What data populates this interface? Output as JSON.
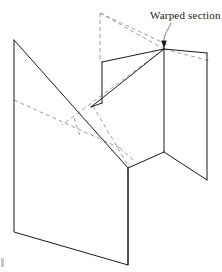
{
  "figure": {
    "background_color": "#ffffff",
    "annotation": {
      "label": "Warped section",
      "text_x": 150,
      "text_y": 19,
      "font_size": 11,
      "color": "#1a1a1a"
    },
    "styles": {
      "solid_color": "#1a1a1a",
      "hidden_color": "#8d8d8d",
      "leader_color": "#5a5a5a",
      "solid_width": 1,
      "hidden_width": 0.85,
      "dash_pattern": "4 3"
    },
    "leader": {
      "path": "M 171 23 C 168 30, 165 33, 164 40",
      "arrow_points": "164,49 161.2,40.5 166.8,40.5"
    },
    "solid_edges": [
      {
        "name": "left-panel-outline",
        "points": "14,40 14,232 128,265 128,168"
      },
      {
        "name": "left-panel-diagonal",
        "points": "14,40 128,168"
      },
      {
        "name": "mid-panel-left-edge-vertical",
        "points": "102,62 102,103"
      },
      {
        "name": "mid-panel-top-edge",
        "points": "102,62 164,49"
      },
      {
        "name": "mid-panel-lower-left-edge",
        "points": "102,103 91,107"
      },
      {
        "name": "warped-upper-fold",
        "points": "91,107 164,49"
      },
      {
        "name": "central-vertical-spine",
        "points": "164,49 164,152"
      },
      {
        "name": "right-panel-top-edge",
        "points": "164,49 207,53"
      },
      {
        "name": "right-panel-right-edge",
        "points": "207,53 207,180"
      },
      {
        "name": "right-panel-bottom-edge",
        "points": "207,180 164,152"
      },
      {
        "name": "base-fold-left",
        "points": "164,152 128,168"
      },
      {
        "name": "base-vertical-drop",
        "points": "128,168 128,265"
      }
    ],
    "hidden_edges": [
      {
        "name": "hidden-vertical-left-riser",
        "points": "100,13 100,62"
      },
      {
        "name": "hidden-apex-to-spine",
        "points": "100,13 168,45"
      },
      {
        "name": "hidden-apex-lower-ray",
        "points": "100,13 164,49"
      },
      {
        "name": "hidden-spine-upper-stub",
        "points": "164,40 164,49"
      },
      {
        "name": "hidden-right-upper-ray",
        "points": "164,49 207,60"
      },
      {
        "name": "hidden-long-diagonal-to-left",
        "points": "164,49 62,125"
      },
      {
        "name": "hidden-left-horizon",
        "points": "14,100 120,148"
      },
      {
        "name": "hidden-short-tick",
        "points": "74,120 80,134"
      },
      {
        "name": "hidden-lower-right-segment",
        "points": "120,148 133,160"
      },
      {
        "name": "hidden-mid-crossing",
        "points": "91,107 128,168"
      }
    ],
    "artifact": {
      "name": "page-edge-mark",
      "x": 1,
      "y": 258,
      "width": 3,
      "height": 9
    }
  }
}
